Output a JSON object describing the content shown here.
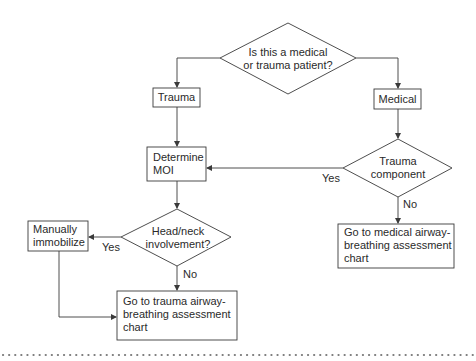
{
  "diagram": {
    "type": "flowchart",
    "nodes": {
      "start": {
        "shape": "decision",
        "line1": "Is this a medical",
        "line2": "or trauma patient?"
      },
      "trauma": {
        "shape": "process",
        "label": "Trauma"
      },
      "medical": {
        "shape": "process",
        "label": "Medical"
      },
      "determine_moi": {
        "shape": "process",
        "line1": "Determine",
        "line2": "MOI"
      },
      "trauma_component": {
        "shape": "decision",
        "line1": "Trauma",
        "line2": "component"
      },
      "head_neck": {
        "shape": "decision",
        "line1": "Head/neck",
        "line2": "involvement?"
      },
      "manually_immobilize": {
        "shape": "process",
        "line1": "Manually",
        "line2": "immobilize"
      },
      "trauma_airway": {
        "shape": "process",
        "line1": "Go to trauma airway-",
        "line2": "breathing assessment",
        "line3": "chart"
      },
      "medical_airway": {
        "shape": "process",
        "line1": "Go to medical airway-",
        "line2": "breathing assessment",
        "line3": "chart"
      }
    },
    "edge_labels": {
      "trauma_component_yes": "Yes",
      "trauma_component_no": "No",
      "head_neck_yes": "Yes",
      "head_neck_no": "No"
    },
    "edges": [
      {
        "from": "start",
        "to": "trauma"
      },
      {
        "from": "start",
        "to": "medical"
      },
      {
        "from": "trauma",
        "to": "determine_moi"
      },
      {
        "from": "medical",
        "to": "trauma_component"
      },
      {
        "from": "trauma_component",
        "to": "determine_moi",
        "label": "Yes"
      },
      {
        "from": "trauma_component",
        "to": "medical_airway",
        "label": "No"
      },
      {
        "from": "determine_moi",
        "to": "head_neck"
      },
      {
        "from": "head_neck",
        "to": "manually_immobilize",
        "label": "Yes"
      },
      {
        "from": "head_neck",
        "to": "trauma_airway",
        "label": "No"
      },
      {
        "from": "manually_immobilize",
        "to": "trauma_airway"
      }
    ],
    "colors": {
      "line": "#3a3a3a",
      "text": "#2a2a2a",
      "background": "#ffffff",
      "dots": "#7a7a7a"
    }
  }
}
